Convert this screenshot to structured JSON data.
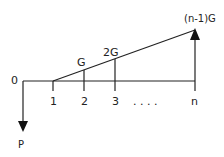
{
  "diagram": {
    "origin_label": "0",
    "period_labels": [
      "1",
      "2",
      "3",
      "n"
    ],
    "ellipsis": ". . . .",
    "gradient_labels": [
      "G",
      "2G",
      "(n-1)G"
    ],
    "present_value_label": "P",
    "colors": {
      "line": "#222222",
      "background": "#ffffff"
    }
  }
}
